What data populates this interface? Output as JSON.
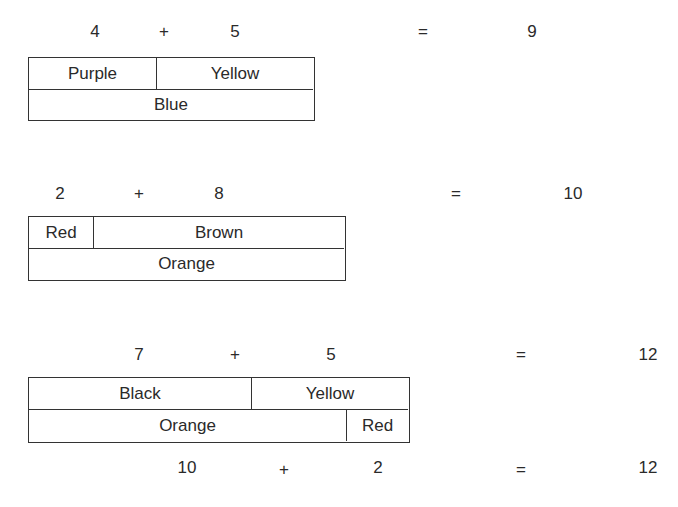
{
  "problems": [
    {
      "equation": {
        "a": "4",
        "op": "+",
        "b": "5",
        "eq": "=",
        "result": "9"
      },
      "bar": {
        "top": [
          "Purple",
          "Yellow"
        ],
        "bottom": [
          "Blue"
        ]
      }
    },
    {
      "equation": {
        "a": "2",
        "op": "+",
        "b": "8",
        "eq": "=",
        "result": "10"
      },
      "bar": {
        "top": [
          "Red",
          "Brown"
        ],
        "bottom": [
          "Orange"
        ]
      }
    },
    {
      "equation": {
        "a": "7",
        "op": "+",
        "b": "5",
        "eq": "=",
        "result": "12"
      },
      "bar": {
        "top": [
          "Black",
          "Yellow"
        ],
        "bottom": [
          "Orange",
          "Red"
        ]
      },
      "equation2": {
        "a": "10",
        "op": "+",
        "b": "2",
        "eq": "=",
        "result": "12"
      }
    }
  ]
}
